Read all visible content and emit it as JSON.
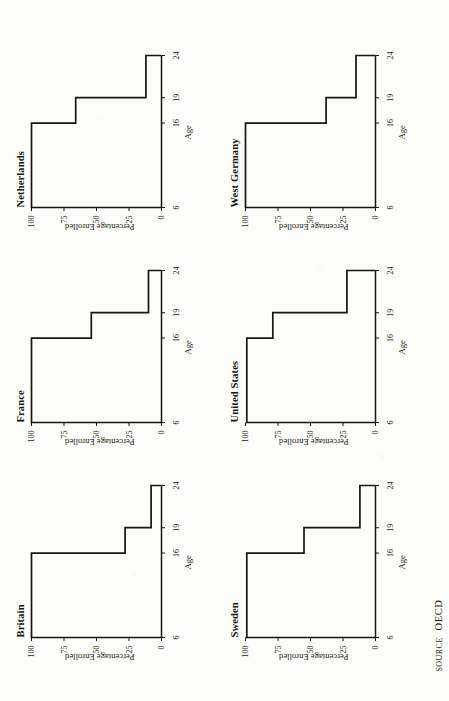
{
  "figure": {
    "background_color": "#fdfdfc",
    "ink_color": "#17160f",
    "source_label": "SOURCE",
    "source_value": "OECD"
  },
  "chart_data": {
    "type": "bar",
    "title": "",
    "xlabel": "Age",
    "ylabel": "Percentage Enrolled",
    "xlim": [
      6,
      24
    ],
    "ylim": [
      0,
      100
    ],
    "grid": false,
    "legend": "none",
    "x_ticks": [
      6,
      16,
      19,
      24
    ],
    "x_tick_labels": [
      "6",
      "16",
      "19",
      "24"
    ],
    "y_ticks": [
      0,
      25,
      50,
      75,
      100
    ],
    "y_tick_labels": [
      "0",
      "25",
      "50",
      "75",
      "100"
    ],
    "categories": [
      "6-16",
      "16-19",
      "19-24"
    ],
    "panels": [
      {
        "name": "Britain",
        "xlabel": "Age",
        "ylabel": "Percentage Enrolled",
        "steps": [
          {
            "x0": 6,
            "x1": 16,
            "value": 100
          },
          {
            "x0": 16,
            "x1": 19,
            "value": 28
          },
          {
            "x0": 19,
            "x1": 24,
            "value": 8
          }
        ]
      },
      {
        "name": "France",
        "xlabel": "Age",
        "ylabel": "Percentage Enrolled",
        "steps": [
          {
            "x0": 6,
            "x1": 16,
            "value": 100
          },
          {
            "x0": 16,
            "x1": 19,
            "value": 54
          },
          {
            "x0": 19,
            "x1": 24,
            "value": 10
          }
        ]
      },
      {
        "name": "Netherlands",
        "xlabel": "Age",
        "ylabel": "Percentage Enrolled",
        "steps": [
          {
            "x0": 6,
            "x1": 16,
            "value": 100
          },
          {
            "x0": 16,
            "x1": 19,
            "value": 66
          },
          {
            "x0": 19,
            "x1": 24,
            "value": 12
          }
        ]
      },
      {
        "name": "Sweden",
        "xlabel": "Age",
        "ylabel": "Percentage Enrolled",
        "steps": [
          {
            "x0": 6,
            "x1": 16,
            "value": 99
          },
          {
            "x0": 16,
            "x1": 19,
            "value": 55
          },
          {
            "x0": 19,
            "x1": 24,
            "value": 12
          }
        ]
      },
      {
        "name": "United States",
        "xlabel": "Age",
        "ylabel": "Percentage Enrolled",
        "steps": [
          {
            "x0": 6,
            "x1": 16,
            "value": 99
          },
          {
            "x0": 16,
            "x1": 19,
            "value": 79
          },
          {
            "x0": 19,
            "x1": 24,
            "value": 22
          }
        ]
      },
      {
        "name": "West Germany",
        "xlabel": "Age",
        "ylabel": "Percentage Enrolled",
        "steps": [
          {
            "x0": 6,
            "x1": 16,
            "value": 100
          },
          {
            "x0": 16,
            "x1": 19,
            "value": 38
          },
          {
            "x0": 19,
            "x1": 24,
            "value": 15
          }
        ]
      }
    ]
  }
}
